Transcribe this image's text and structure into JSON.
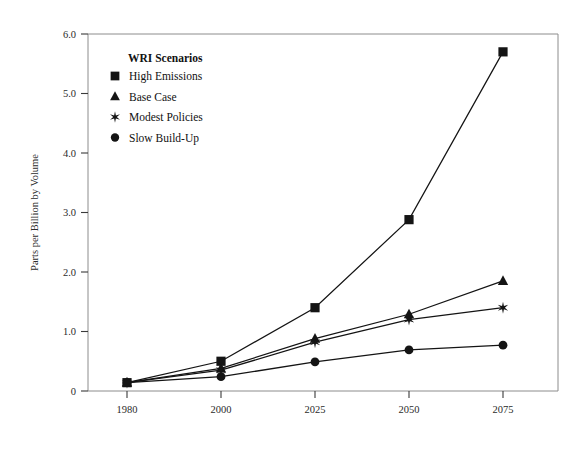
{
  "chart_data": {
    "type": "line",
    "title": "",
    "xlabel": "",
    "ylabel": "Parts per Billion by Volume",
    "categories": [
      "1980",
      "2000",
      "2025",
      "2050",
      "2075"
    ],
    "ylim": [
      0,
      6.0
    ],
    "yticks": [
      "0",
      "1.0",
      "2.0",
      "3.0",
      "4.0",
      "5.0",
      "6.0"
    ],
    "ytick_values": [
      0,
      1.0,
      2.0,
      3.0,
      4.0,
      5.0,
      6.0
    ],
    "grid": false,
    "legend_position": "upper-left-inside",
    "legend_title": "WRI Scenarios",
    "series": [
      {
        "name": "High Emissions",
        "marker": "square",
        "values": [
          0.14,
          0.5,
          1.4,
          2.88,
          5.7
        ]
      },
      {
        "name": "Base Case",
        "marker": "triangle",
        "values": [
          0.14,
          0.38,
          0.88,
          1.29,
          1.85
        ]
      },
      {
        "name": "Modest Policies",
        "marker": "star",
        "values": [
          0.14,
          0.35,
          0.82,
          1.2,
          1.4
        ]
      },
      {
        "name": "Slow Build-Up",
        "marker": "circle",
        "values": [
          0.14,
          0.24,
          0.49,
          0.69,
          0.77
        ]
      }
    ]
  },
  "figure": {
    "background_color": "#ffffff",
    "ink_color": "#141414",
    "frame_color": "#8c8c8c"
  }
}
